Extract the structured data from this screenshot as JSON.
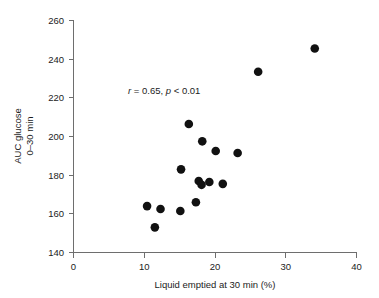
{
  "figure": {
    "background_color": "#ffffff",
    "marker_color": "#111111",
    "axis_color": "#6e6e6e"
  },
  "annotation": {
    "r_symbol": "r",
    "r_text": " = 0.65, ",
    "p_symbol": "p",
    "p_text": " < 0.01",
    "full_text": "r = 0.65, p < 0.01"
  },
  "xaxis": {
    "label": "Liquid emptied at 30 min (%)",
    "ticks": [
      "0",
      "10",
      "20",
      "30",
      "40"
    ],
    "min": 0,
    "max": 40
  },
  "yaxis": {
    "label_line1": "AUC glucose",
    "label_line2": "0–30 min",
    "ticks": [
      "140",
      "160",
      "180",
      "200",
      "220",
      "240",
      "260"
    ],
    "min": 140,
    "max": 260
  },
  "chart_data": {
    "type": "scatter",
    "title": "",
    "xlabel": "Liquid emptied at 30 min (%)",
    "ylabel": "AUC glucose 0–30 min",
    "xlim": [
      0,
      40
    ],
    "ylim": [
      140,
      260
    ],
    "xticks": [
      0,
      10,
      20,
      30,
      40
    ],
    "yticks": [
      140,
      160,
      180,
      200,
      220,
      240,
      260
    ],
    "grid": false,
    "legend": "none",
    "annotations": [
      "r = 0.65, p < 0.01"
    ],
    "series": [
      {
        "name": "Subjects",
        "marker": "filled-circle",
        "color": "#111111",
        "points": [
          {
            "x": 10.4,
            "y": 164.0
          },
          {
            "x": 11.5,
            "y": 153.0
          },
          {
            "x": 12.3,
            "y": 162.5
          },
          {
            "x": 15.1,
            "y": 161.5
          },
          {
            "x": 15.2,
            "y": 183.0
          },
          {
            "x": 16.3,
            "y": 206.5
          },
          {
            "x": 17.3,
            "y": 166.0
          },
          {
            "x": 17.7,
            "y": 177.0
          },
          {
            "x": 18.1,
            "y": 175.0
          },
          {
            "x": 18.2,
            "y": 197.5
          },
          {
            "x": 19.2,
            "y": 176.5
          },
          {
            "x": 20.1,
            "y": 192.5
          },
          {
            "x": 21.1,
            "y": 175.5
          },
          {
            "x": 23.2,
            "y": 191.5
          },
          {
            "x": 26.1,
            "y": 233.5
          },
          {
            "x": 34.1,
            "y": 245.5
          }
        ]
      }
    ],
    "n": 16,
    "statistics": {
      "r": 0.65,
      "p": "< 0.01"
    }
  }
}
